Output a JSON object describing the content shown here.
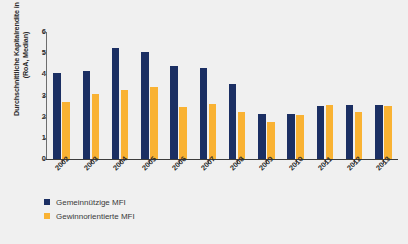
{
  "chart_data": {
    "type": "bar",
    "title": "",
    "subtitle": "",
    "xlabel": "",
    "ylabel": "Durchschnittliche Kapitalrendite in % (RoA, Median)",
    "ylabel_line1": "Durchschnittliche Kapitalrendite in %",
    "ylabel_line2": "(RoA, Median)",
    "ylim": [
      0,
      6
    ],
    "yticks": [
      "0",
      "1",
      "2",
      "3",
      "4",
      "5",
      "6"
    ],
    "grid": false,
    "legend_position": "bottom-left",
    "categories": [
      "2002",
      "2003",
      "2004",
      "2005",
      "2006",
      "2007",
      "2008",
      "2009",
      "2010",
      "2011",
      "2012",
      "2013"
    ],
    "series": [
      {
        "name": "Gemeinnützige MFI",
        "color": "#1b2f63",
        "values": [
          4.05,
          4.15,
          5.25,
          5.05,
          4.4,
          4.3,
          3.55,
          2.15,
          2.15,
          2.5,
          2.55,
          2.55
        ]
      },
      {
        "name": "Gewinnorientierte MFI",
        "color": "#f9b233",
        "values": [
          2.7,
          3.05,
          3.25,
          3.4,
          2.45,
          2.6,
          2.2,
          1.75,
          2.1,
          2.55,
          2.2,
          2.5
        ]
      }
    ]
  },
  "colors": {
    "primary": "#1b2f63",
    "secondary": "#f9b233",
    "background": "#f0f0f0",
    "axis": "#3c3c3c",
    "text": "#2b2b2b"
  }
}
